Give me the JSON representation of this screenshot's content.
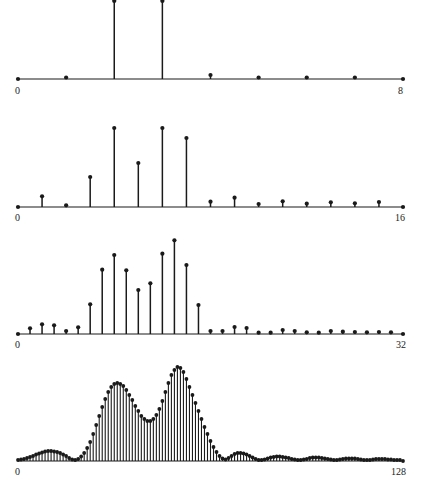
{
  "chart_data": [
    {
      "type": "stem",
      "title": "",
      "xlabel": "",
      "ylabel": "",
      "x_start_label": "0",
      "x_end_label": "8",
      "xlim": [
        0,
        8
      ],
      "n": 8,
      "axis_y": 79,
      "values": [
        0,
        1.5,
        79,
        79,
        4,
        1.5,
        1.5,
        1.5,
        0
      ],
      "clip_top": true
    },
    {
      "type": "stem",
      "title": "",
      "xlabel": "",
      "ylabel": "",
      "x_start_label": "0",
      "x_end_label": "16",
      "xlim": [
        0,
        16
      ],
      "n": 16,
      "axis_y": 207,
      "values": [
        0,
        10.7,
        1.7,
        30,
        79,
        44,
        79,
        69,
        5.3,
        9.3,
        3,
        5.7,
        3.3,
        4.7,
        3.7,
        5,
        0
      ]
    },
    {
      "type": "stem",
      "title": "",
      "xlabel": "",
      "ylabel": "",
      "x_start_label": "0",
      "x_end_label": "32",
      "xlim": [
        0,
        32
      ],
      "n": 32,
      "axis_y": 334,
      "values": [
        0,
        5.7,
        9.7,
        8.7,
        3,
        6.7,
        29.7,
        64.3,
        79,
        63.7,
        44,
        50.7,
        80.3,
        93.7,
        69,
        29,
        3,
        3,
        7,
        6,
        1.3,
        1.3,
        4,
        3,
        1.7,
        1.3,
        3,
        2.3,
        2,
        1.7,
        2,
        1.7,
        0
      ]
    },
    {
      "type": "stem",
      "title": "",
      "xlabel": "",
      "ylabel": "",
      "x_start_label": "0",
      "x_end_label": "128",
      "xlim": [
        0,
        128
      ],
      "n": 128,
      "axis_y": 461,
      "values": [
        1,
        1.5,
        2,
        3,
        4,
        5,
        6.5,
        7.5,
        8.5,
        9.5,
        10,
        10,
        9.5,
        9,
        8,
        6.5,
        5,
        3,
        1.5,
        1,
        2,
        4.5,
        8,
        13,
        19,
        27,
        36,
        45,
        54,
        62,
        69,
        74,
        77,
        78,
        77,
        75,
        71,
        66,
        61,
        55,
        50,
        45,
        42,
        40,
        40,
        42,
        46,
        52,
        60,
        69,
        78,
        86,
        91,
        94,
        93,
        89,
        82,
        74,
        66,
        58,
        50,
        42,
        34,
        27,
        20,
        14,
        9,
        5,
        2.5,
        1.5,
        3,
        5,
        7,
        8,
        8,
        7.5,
        6.5,
        5,
        3.5,
        2,
        1,
        1,
        1.5,
        2.5,
        3.5,
        4,
        4.5,
        4.5,
        4,
        3.5,
        3,
        2,
        1.5,
        1,
        1,
        1.5,
        2,
        3,
        3.5,
        3.5,
        3.5,
        3,
        2.5,
        2,
        1.5,
        1,
        1,
        1.5,
        2,
        2.5,
        2.5,
        2.5,
        2.5,
        2,
        1.5,
        1,
        1,
        1,
        1.5,
        2,
        2,
        2,
        2,
        1.5,
        1.5,
        1,
        1,
        1,
        0
      ]
    }
  ],
  "layout": {
    "x_left": 18,
    "x_right": 403,
    "stroke_color": "#1a1a1a"
  }
}
